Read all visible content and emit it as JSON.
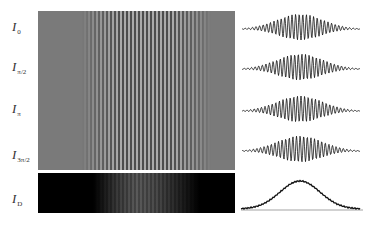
{
  "figure": {
    "rows": [
      {
        "label_main": "I",
        "label_sub": "0",
        "phase": "0"
      },
      {
        "label_main": "I",
        "label_sub": "π/2",
        "phase": "π/2"
      },
      {
        "label_main": "I",
        "label_sub": "π",
        "phase": "π"
      },
      {
        "label_main": "I",
        "label_sub": "3π/2",
        "phase": "3π/2"
      },
      {
        "label_main": "I",
        "label_sub": "D",
        "phase": "DC"
      }
    ],
    "colors": {
      "fringe_panel_gray": "#7a7a7a",
      "dc_panel": "#000000",
      "plot_line": "#111111",
      "background": "#ffffff"
    }
  },
  "chart_data": [
    {
      "type": "line",
      "title": "I_0 profile",
      "description": "modulated fringe signal with Gaussian envelope",
      "xlabel": "",
      "ylabel": "",
      "envelope_center": 0.5,
      "fringe_period_px": 4
    },
    {
      "type": "line",
      "title": "I_π/2 profile",
      "description": "modulated fringe signal with Gaussian envelope, phase shifted π/2",
      "xlabel": "",
      "ylabel": ""
    },
    {
      "type": "line",
      "title": "I_π profile",
      "description": "modulated fringe signal with Gaussian envelope, phase shifted π",
      "xlabel": "",
      "ylabel": ""
    },
    {
      "type": "line",
      "title": "I_3π/2 profile",
      "description": "modulated fringe signal with Gaussian envelope, phase shifted 3π/2",
      "xlabel": "",
      "ylabel": ""
    },
    {
      "type": "line",
      "title": "I_D profile",
      "description": "DC envelope (Gaussian-like bump) above baseline",
      "xlabel": "",
      "ylabel": ""
    }
  ]
}
